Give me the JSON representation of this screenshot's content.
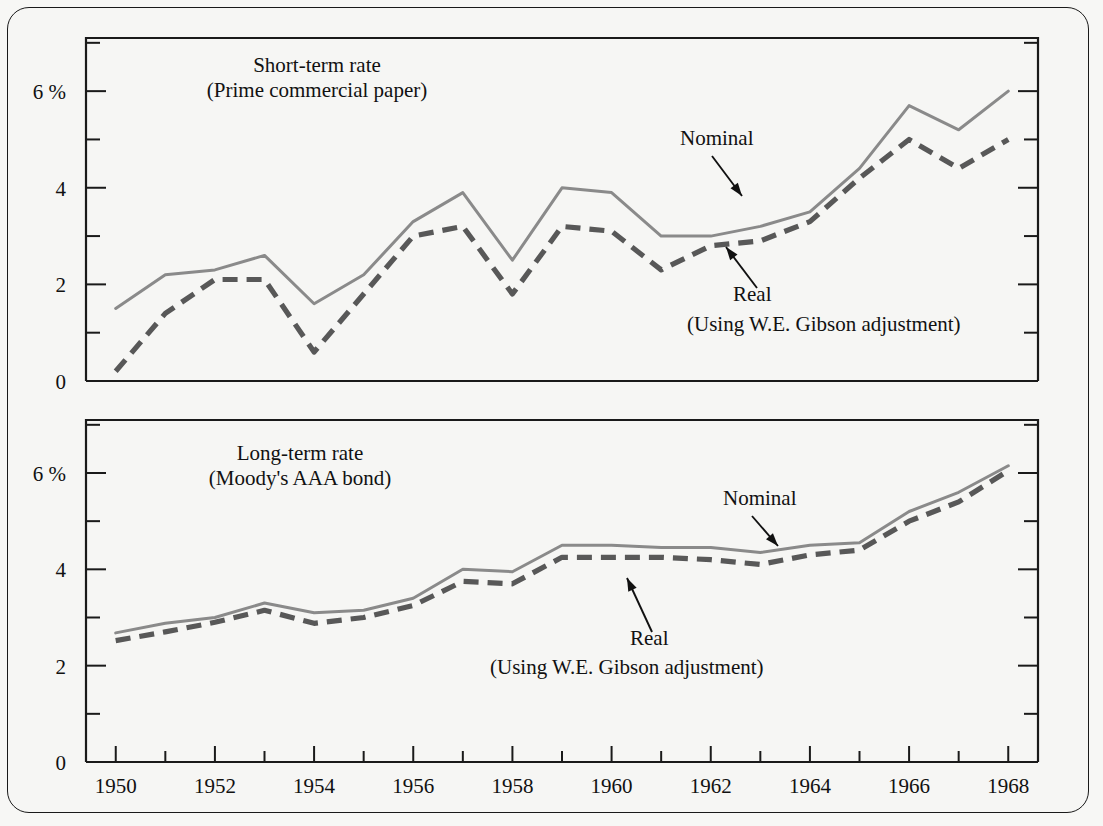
{
  "figure": {
    "background_color": "#f6f6f4",
    "border_color": "#1a1a1a",
    "nominal_color": "#8a8a8a",
    "real_color": "#585858"
  },
  "chart_data": [
    {
      "type": "line",
      "title": "Short-term rate",
      "subtitle": "(Prime commercial paper)",
      "xlabel": "",
      "ylabel": "",
      "ytick_labels": [
        "0",
        "2",
        "4",
        "6 %"
      ],
      "ytick_values": [
        0,
        2,
        4,
        6
      ],
      "ylim": [
        0,
        7.1
      ],
      "xlim": [
        1949.4,
        1968.6
      ],
      "xtick_labels": [
        "1950",
        "1952",
        "1954",
        "1956",
        "1958",
        "1960",
        "1962",
        "1964",
        "1966",
        "1968"
      ],
      "xtick_values": [
        1950,
        1952,
        1954,
        1956,
        1958,
        1960,
        1962,
        1964,
        1966,
        1968
      ],
      "minor_ytick_values": [
        1,
        3,
        5,
        7
      ],
      "minor_xtick_values": [
        1951,
        1953,
        1955,
        1957,
        1959,
        1961,
        1963,
        1965,
        1967
      ],
      "grid": false,
      "legend_position": "inline-annotation",
      "x": [
        1950,
        1951,
        1952,
        1953,
        1954,
        1955,
        1956,
        1957,
        1958,
        1959,
        1960,
        1961,
        1962,
        1963,
        1964,
        1965,
        1966,
        1967,
        1968
      ],
      "series": [
        {
          "name": "Nominal",
          "style": "solid",
          "values": [
            1.5,
            2.2,
            2.3,
            2.6,
            1.6,
            2.2,
            3.3,
            3.9,
            2.5,
            4.0,
            3.9,
            3.0,
            3.0,
            3.2,
            3.5,
            4.4,
            5.7,
            5.2,
            6.0
          ]
        },
        {
          "name": "Real",
          "style": "dashed",
          "note": "(Using W.E. Gibson adjustment)",
          "values": [
            0.2,
            1.4,
            2.1,
            2.1,
            0.6,
            1.8,
            3.0,
            3.2,
            1.8,
            3.2,
            3.1,
            2.3,
            2.8,
            2.9,
            3.3,
            4.2,
            5.0,
            4.4,
            5.0
          ]
        }
      ],
      "annotations": [
        {
          "text": "Nominal",
          "label_x": 680,
          "label_y": 145,
          "arrow_from_x": 712,
          "arrow_from_y": 156,
          "arrow_to_x": 742,
          "arrow_to_y": 196
        },
        {
          "text": "Real",
          "label_x": 733,
          "label_y": 301,
          "arrow_from_x": 757,
          "arrow_from_y": 288,
          "arrow_to_x": 726,
          "arrow_to_y": 247
        },
        {
          "text": "(Using W.E. Gibson adjustment)",
          "label_x": 687,
          "label_y": 331
        }
      ]
    },
    {
      "type": "line",
      "title": "Long-term rate",
      "subtitle": "(Moody's AAA bond)",
      "xlabel": "",
      "ylabel": "",
      "ytick_labels": [
        "0",
        "2",
        "4",
        "6 %"
      ],
      "ytick_values": [
        0,
        2,
        4,
        6
      ],
      "ylim": [
        0,
        7.1
      ],
      "xlim": [
        1949.4,
        1968.6
      ],
      "xtick_labels": [
        "1950",
        "1952",
        "1954",
        "1956",
        "1958",
        "1960",
        "1962",
        "1964",
        "1966",
        "1968"
      ],
      "xtick_values": [
        1950,
        1952,
        1954,
        1956,
        1958,
        1960,
        1962,
        1964,
        1966,
        1968
      ],
      "minor_ytick_values": [
        1,
        3,
        5,
        7
      ],
      "minor_xtick_values": [
        1951,
        1953,
        1955,
        1957,
        1959,
        1961,
        1963,
        1965,
        1967
      ],
      "grid": false,
      "legend_position": "inline-annotation",
      "x": [
        1950,
        1951,
        1952,
        1953,
        1954,
        1955,
        1956,
        1957,
        1958,
        1959,
        1960,
        1961,
        1962,
        1963,
        1964,
        1965,
        1966,
        1967,
        1968
      ],
      "series": [
        {
          "name": "Nominal",
          "style": "solid",
          "values": [
            2.68,
            2.88,
            3.0,
            3.3,
            3.1,
            3.15,
            3.4,
            4.0,
            3.95,
            4.5,
            4.5,
            4.45,
            4.45,
            4.35,
            4.5,
            4.55,
            5.2,
            5.6,
            6.15
          ]
        },
        {
          "name": "Real",
          "style": "dashed",
          "note": "(Using W.E. Gibson adjustment)",
          "values": [
            2.52,
            2.7,
            2.9,
            3.15,
            2.88,
            3.0,
            3.25,
            3.75,
            3.7,
            4.25,
            4.25,
            4.25,
            4.2,
            4.1,
            4.3,
            4.4,
            5.0,
            5.4,
            6.05
          ]
        }
      ],
      "annotations": [
        {
          "text": "Nominal",
          "label_x": 723,
          "label_y": 505,
          "arrow_from_x": 752,
          "arrow_from_y": 516,
          "arrow_to_x": 778,
          "arrow_to_y": 546
        },
        {
          "text": "Real",
          "label_x": 630,
          "label_y": 645,
          "arrow_from_x": 652,
          "arrow_from_y": 632,
          "arrow_to_x": 627,
          "arrow_to_y": 578
        },
        {
          "text": "(Using W.E. Gibson adjustment)",
          "label_x": 490,
          "label_y": 674
        }
      ]
    }
  ]
}
